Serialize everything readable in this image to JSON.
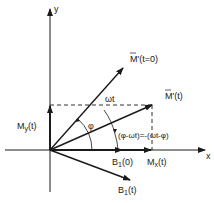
{
  "diagram": {
    "axes": {
      "x_label": "x",
      "y_label": "y"
    },
    "vectors": {
      "m_prime_t0": {
        "label": "M'(t=0)"
      },
      "m_prime_t": {
        "label": "M'(t)"
      },
      "b1_0": {
        "label_main": "B",
        "label_sub": "1",
        "label_arg": "(0)"
      },
      "b1_t": {
        "label_main": "B",
        "label_sub": "1",
        "label_arg": "(t)"
      }
    },
    "components": {
      "mx": {
        "label_main": "M",
        "label_sub": "x",
        "label_arg": "(t)"
      },
      "my": {
        "label_main": "M",
        "label_sub": "y",
        "label_arg": "(t)"
      }
    },
    "angles": {
      "omega_t": "ωt",
      "phi": "φ",
      "phase_relation": "(φ-ωt)=-(ωt-φ)"
    },
    "colors": {
      "ink": "#1a1a1a",
      "background": "#ffffff"
    }
  }
}
